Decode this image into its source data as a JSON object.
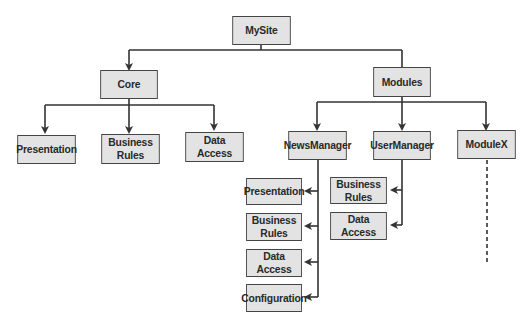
{
  "diagram": {
    "type": "hierarchy-tree",
    "root": {
      "id": "mysite",
      "label": "MySite"
    },
    "level1": [
      {
        "id": "core",
        "label": "Core"
      },
      {
        "id": "modules",
        "label": "Modules"
      }
    ],
    "core_children": [
      {
        "id": "core-presentation",
        "label": "Presentation"
      },
      {
        "id": "core-business-rules",
        "label": "Business Rules"
      },
      {
        "id": "core-data-access",
        "label": "Data Access"
      }
    ],
    "modules_children": [
      {
        "id": "newsmanager",
        "label": "NewsManager"
      },
      {
        "id": "usermanager",
        "label": "UserManager"
      },
      {
        "id": "modulex",
        "label": "ModuleX",
        "continuation": "dashed"
      }
    ],
    "newsmanager_children": [
      {
        "id": "nm-presentation",
        "label": "Presentation"
      },
      {
        "id": "nm-business-rules",
        "label": "Business Rules"
      },
      {
        "id": "nm-data-access",
        "label": "Data Access"
      },
      {
        "id": "nm-configuration",
        "label": "Configuration"
      }
    ],
    "usermanager_children": [
      {
        "id": "um-business-rules",
        "label": "Business Rules"
      },
      {
        "id": "um-data-access",
        "label": "Data Access"
      }
    ],
    "colors": {
      "box_fill": "#e3e3e3",
      "box_border": "#444444",
      "line": "#333333",
      "background": "#ffffff"
    }
  }
}
